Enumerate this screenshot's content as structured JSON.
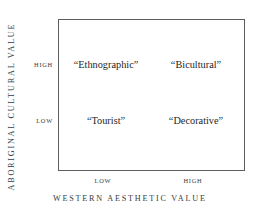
{
  "chart_data": {
    "type": "matrix",
    "title": "",
    "xlabel": "WESTERN AESTHETIC VALUE",
    "ylabel": "ABORIGINAL CULTURAL VALUE",
    "x_ticks": [
      "LOW",
      "HIGH"
    ],
    "y_ticks": [
      "HIGH",
      "LOW"
    ],
    "grid": false,
    "legend": false,
    "cells": [
      {
        "x": "LOW",
        "y": "HIGH",
        "label": "“Ethnographic”"
      },
      {
        "x": "HIGH",
        "y": "HIGH",
        "label": "“Bicultural”"
      },
      {
        "x": "LOW",
        "y": "LOW",
        "label": "“Tourist”"
      },
      {
        "x": "HIGH",
        "y": "LOW",
        "label": "“Decorative”"
      }
    ],
    "colors": {
      "border": "#5d5d5d",
      "background": "#ffffff",
      "text": "#262626",
      "axis_text": "#3a3a3a"
    }
  },
  "axes": {
    "y_title": "ABORIGINAL CULTURAL VALUE",
    "x_title": "WESTERN AESTHETIC VALUE",
    "y_tick_high": "HIGH",
    "y_tick_low": "LOW",
    "x_tick_low": "LOW",
    "x_tick_high": "HIGH"
  },
  "quadrants": {
    "top_left": "“Ethnographic”",
    "top_right": "“Bicultural”",
    "bottom_left": "“Tourist”",
    "bottom_right": "“Decorative”"
  }
}
